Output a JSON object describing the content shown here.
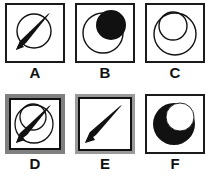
{
  "figure": {
    "background_color": "#ffffff",
    "ink_color": "#111111",
    "gray_frame_color": "#808080",
    "gray_frame_light": "#9a9a9a",
    "rows": 2,
    "columns": 3,
    "panels": [
      {
        "id": "A",
        "label": "A",
        "frame_style": "plain-black",
        "shapes": [
          "circle-outline",
          "needle-wedge"
        ],
        "description": "outlined circle crossed by a black tapered needle wedge running lower-left to upper-right"
      },
      {
        "id": "B",
        "label": "B",
        "frame_style": "plain-black",
        "shapes": [
          "circle-outline",
          "filled-black-circle"
        ],
        "description": "large outlined circle with a solid black circle overlapping at the upper right"
      },
      {
        "id": "C",
        "label": "C",
        "frame_style": "plain-black",
        "shapes": [
          "circle-outline",
          "circle-outline-small"
        ],
        "description": "two overlapping outlined circles, the smaller one set into the upper left"
      },
      {
        "id": "D",
        "label": "D",
        "frame_style": "gray-thick-black-inner",
        "shapes": [
          "circle-outline",
          "circle-outline-small",
          "needle-wedge"
        ],
        "description": "two overlapping outlined circles crossed by the black needle wedge, thick gray frame"
      },
      {
        "id": "E",
        "label": "E",
        "frame_style": "gray-thin-black-inner",
        "shapes": [
          "needle-wedge"
        ],
        "description": "black tapered needle wedge alone, gray frame with thin black inner line"
      },
      {
        "id": "F",
        "label": "F",
        "frame_style": "plain-black",
        "shapes": [
          "filled-black-circle",
          "white-circle-cutout"
        ],
        "description": "solid black disc with a white circular bite removed at the upper right forming a crescent"
      }
    ]
  }
}
